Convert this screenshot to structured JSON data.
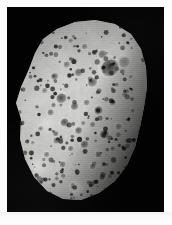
{
  "image": {
    "subject": "Hyperion",
    "subject_type": "irregular heavily cratered moon",
    "background_color": "#020202",
    "frame_color": "#fdfdfd",
    "caption": "",
    "rendering": "grayscale photograph"
  },
  "frame": {
    "border_px": 7,
    "plate_width": 157,
    "plate_height": 205
  },
  "chart_data": {
    "type": "scatter",
    "xlabel": "",
    "ylabel": "",
    "note": "Crater positions and radii in plate pixel coordinates (157x205 plate).",
    "body_outline": "M 36,32 L 50,22 L 68,15 L 88,13 L 108,17 L 124,27 L 134,42 L 139,60 L 140,80 L 137,100 L 133,120 L 128,140 L 120,158 L 108,174 L 92,186 L 74,193 L 56,192 L 40,184 L 27,170 L 18,152 L 13,132 L 14,112 L 9,96 L 14,80 L 22,62 L 28,46 Z",
    "terminator_shadow": true,
    "craters": [
      {
        "x": 104,
        "y": 62,
        "r": 9.5,
        "depth": 0.82
      },
      {
        "x": 118,
        "y": 56,
        "r": 6.0,
        "depth": 0.4
      },
      {
        "x": 96,
        "y": 48,
        "r": 4.5,
        "depth": 0.55
      },
      {
        "x": 86,
        "y": 76,
        "r": 5.0,
        "depth": 0.62
      },
      {
        "x": 72,
        "y": 66,
        "r": 4.2,
        "depth": 0.58
      },
      {
        "x": 60,
        "y": 58,
        "r": 3.4,
        "depth": 0.5
      },
      {
        "x": 48,
        "y": 70,
        "r": 3.8,
        "depth": 0.6
      },
      {
        "x": 38,
        "y": 84,
        "r": 3.0,
        "depth": 0.45
      },
      {
        "x": 55,
        "y": 92,
        "r": 5.5,
        "depth": 0.74
      },
      {
        "x": 68,
        "y": 100,
        "r": 4.0,
        "depth": 0.66
      },
      {
        "x": 80,
        "y": 96,
        "r": 3.2,
        "depth": 0.52
      },
      {
        "x": 92,
        "y": 104,
        "r": 4.6,
        "depth": 0.7
      },
      {
        "x": 106,
        "y": 96,
        "r": 3.6,
        "depth": 0.48
      },
      {
        "x": 118,
        "y": 88,
        "r": 3.0,
        "depth": 0.42
      },
      {
        "x": 44,
        "y": 106,
        "r": 3.4,
        "depth": 0.56
      },
      {
        "x": 58,
        "y": 116,
        "r": 4.4,
        "depth": 0.72
      },
      {
        "x": 72,
        "y": 124,
        "r": 3.8,
        "depth": 0.64
      },
      {
        "x": 86,
        "y": 118,
        "r": 3.0,
        "depth": 0.5
      },
      {
        "x": 98,
        "y": 128,
        "r": 4.8,
        "depth": 0.76
      },
      {
        "x": 112,
        "y": 120,
        "r": 3.2,
        "depth": 0.46
      },
      {
        "x": 34,
        "y": 122,
        "r": 2.8,
        "depth": 0.44
      },
      {
        "x": 50,
        "y": 134,
        "r": 3.6,
        "depth": 0.6
      },
      {
        "x": 64,
        "y": 142,
        "r": 3.0,
        "depth": 0.54
      },
      {
        "x": 78,
        "y": 138,
        "r": 4.2,
        "depth": 0.68
      },
      {
        "x": 92,
        "y": 148,
        "r": 3.4,
        "depth": 0.58
      },
      {
        "x": 106,
        "y": 142,
        "r": 2.8,
        "depth": 0.44
      },
      {
        "x": 40,
        "y": 148,
        "r": 3.0,
        "depth": 0.5
      },
      {
        "x": 56,
        "y": 158,
        "r": 3.4,
        "depth": 0.56
      },
      {
        "x": 70,
        "y": 164,
        "r": 2.6,
        "depth": 0.42
      },
      {
        "x": 86,
        "y": 160,
        "r": 3.0,
        "depth": 0.52
      },
      {
        "x": 100,
        "y": 158,
        "r": 2.4,
        "depth": 0.4
      },
      {
        "x": 50,
        "y": 172,
        "r": 2.6,
        "depth": 0.44
      },
      {
        "x": 66,
        "y": 178,
        "r": 2.2,
        "depth": 0.38
      },
      {
        "x": 82,
        "y": 176,
        "r": 2.8,
        "depth": 0.46
      },
      {
        "x": 30,
        "y": 100,
        "r": 2.4,
        "depth": 0.4
      },
      {
        "x": 26,
        "y": 136,
        "r": 2.2,
        "depth": 0.36
      },
      {
        "x": 78,
        "y": 40,
        "r": 3.0,
        "depth": 0.48
      },
      {
        "x": 64,
        "y": 34,
        "r": 2.6,
        "depth": 0.42
      },
      {
        "x": 110,
        "y": 78,
        "r": 2.6,
        "depth": 0.44
      },
      {
        "x": 124,
        "y": 70,
        "r": 2.2,
        "depth": 0.36
      },
      {
        "x": 126,
        "y": 104,
        "r": 2.4,
        "depth": 0.38
      },
      {
        "x": 120,
        "y": 134,
        "r": 2.6,
        "depth": 0.42
      }
    ],
    "bright_patches": [
      {
        "x": 30,
        "y": 160,
        "r": 16
      },
      {
        "x": 54,
        "y": 50,
        "r": 14
      },
      {
        "x": 116,
        "y": 44,
        "r": 12
      },
      {
        "x": 70,
        "y": 182,
        "r": 13
      }
    ]
  }
}
